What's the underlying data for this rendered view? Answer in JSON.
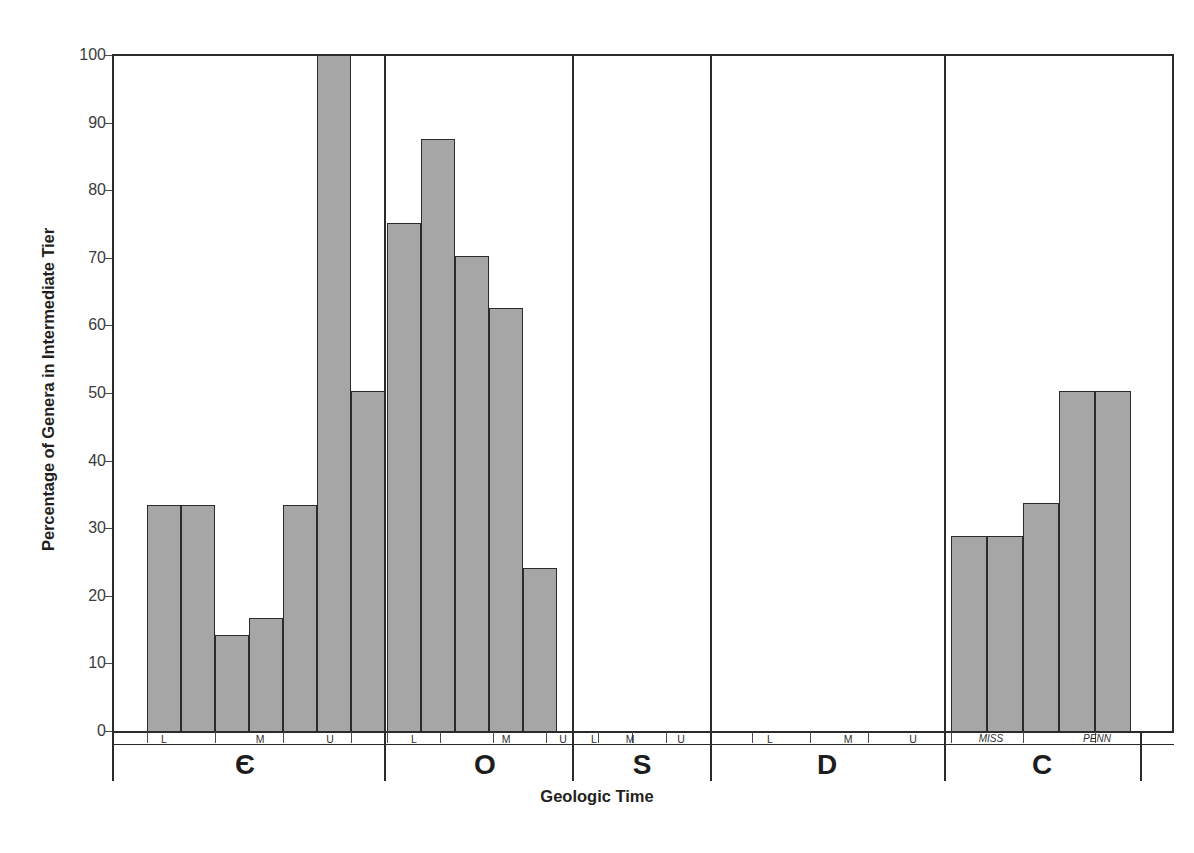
{
  "chart_data": {
    "type": "bar",
    "title": "",
    "xlabel": "Geologic Time",
    "ylabel": "Percentage of Genera in Intermediate Tier",
    "ylim": [
      0,
      100
    ],
    "ytick_labels": [
      "0",
      "10",
      "20",
      "30",
      "40",
      "50",
      "60",
      "70",
      "80",
      "90",
      "100"
    ],
    "ytick_values": [
      0,
      10,
      20,
      30,
      40,
      50,
      60,
      70,
      80,
      90,
      100
    ],
    "grid": false,
    "legend": "none",
    "bar_fill_color": "#a6a6a6",
    "bar_edge_color": "#2b2b2b",
    "periods": [
      {
        "symbol": "Є",
        "name": "Cambrian",
        "epoch_labels": [
          "L",
          "M",
          "U"
        ],
        "bins": [
          {
            "index": 1,
            "value": null
          },
          {
            "index": 2,
            "value": 33.5
          },
          {
            "index": 3,
            "value": 33.5
          },
          {
            "index": 4,
            "value": 14.3
          },
          {
            "index": 5,
            "value": 16.8
          },
          {
            "index": 6,
            "value": 33.5
          },
          {
            "index": 7,
            "value": 100.0
          },
          {
            "index": 8,
            "value": 50.3
          }
        ]
      },
      {
        "symbol": "O",
        "name": "Ordovician",
        "epoch_labels": [
          "L",
          "M",
          "U"
        ],
        "bins": [
          {
            "index": 1,
            "value": 75.2
          },
          {
            "index": 2,
            "value": 87.6
          },
          {
            "index": 3,
            "value": 70.2
          },
          {
            "index": 4,
            "value": 62.6
          },
          {
            "index": 5,
            "value": 24.2
          },
          {
            "index": 6,
            "value": null
          }
        ]
      },
      {
        "symbol": "S",
        "name": "Silurian",
        "epoch_labels": [
          "L",
          "M",
          "U"
        ],
        "bins": [
          {
            "index": 1,
            "value": null
          },
          {
            "index": 2,
            "value": null
          },
          {
            "index": 3,
            "value": null
          },
          {
            "index": 4,
            "value": null
          }
        ]
      },
      {
        "symbol": "D",
        "name": "Devonian",
        "epoch_labels": [
          "L",
          "M",
          "U"
        ],
        "bins": [
          {
            "index": 1,
            "value": null
          },
          {
            "index": 2,
            "value": null
          },
          {
            "index": 3,
            "value": null
          },
          {
            "index": 4,
            "value": null
          },
          {
            "index": 5,
            "value": null
          },
          {
            "index": 6,
            "value": null
          }
        ]
      },
      {
        "symbol": "C",
        "name": "Carboniferous",
        "epoch_labels": [
          "MISS",
          "PENN"
        ],
        "bins": [
          {
            "index": 1,
            "value": 28.9
          },
          {
            "index": 2,
            "value": 28.9
          },
          {
            "index": 3,
            "value": 33.7
          },
          {
            "index": 4,
            "value": 50.3
          },
          {
            "index": 5,
            "value": 50.3
          }
        ]
      }
    ]
  },
  "axes": {
    "y_title": "Percentage of Genera in Intermediate Tier",
    "x_title": "Geologic Time",
    "y_ticks": [
      "100",
      "90",
      "80",
      "70",
      "60",
      "50",
      "40",
      "30",
      "20",
      "10",
      "0"
    ]
  },
  "period_symbols": {
    "cambrian": "Є",
    "ordovician": "O",
    "silurian": "S",
    "devonian": "D",
    "carboniferous": "C"
  },
  "epoch_labels": {
    "cambrian": [
      "L",
      "M",
      "U"
    ],
    "ordovician": [
      "L",
      "M",
      "U"
    ],
    "silurian": [
      "L",
      "M",
      "U"
    ],
    "devonian": [
      "L",
      "M",
      "U"
    ],
    "carboniferous": [
      "MISS",
      "PENN"
    ]
  }
}
